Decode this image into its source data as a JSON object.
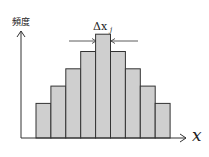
{
  "chart_data": {
    "type": "bar",
    "title": "",
    "xlabel": "x",
    "ylabel": "頻度",
    "annotation": {
      "text": "Δx",
      "subscript": "j",
      "target_bar_index": 4
    },
    "categories": [
      "1",
      "2",
      "3",
      "4",
      "5",
      "6",
      "7",
      "8",
      "9"
    ],
    "values": [
      2,
      3,
      4,
      5,
      6,
      5,
      4,
      3,
      2
    ],
    "bar_color": "#cfcfcf",
    "edge_color": "#333333",
    "grid": false
  },
  "labels": {
    "y_axis": "頻度",
    "x_axis": "x",
    "delta": "Δx",
    "delta_sub": "j"
  },
  "colors": {
    "bar_fill": "#cfcfcf",
    "line": "#333333",
    "background": "#ffffff"
  }
}
